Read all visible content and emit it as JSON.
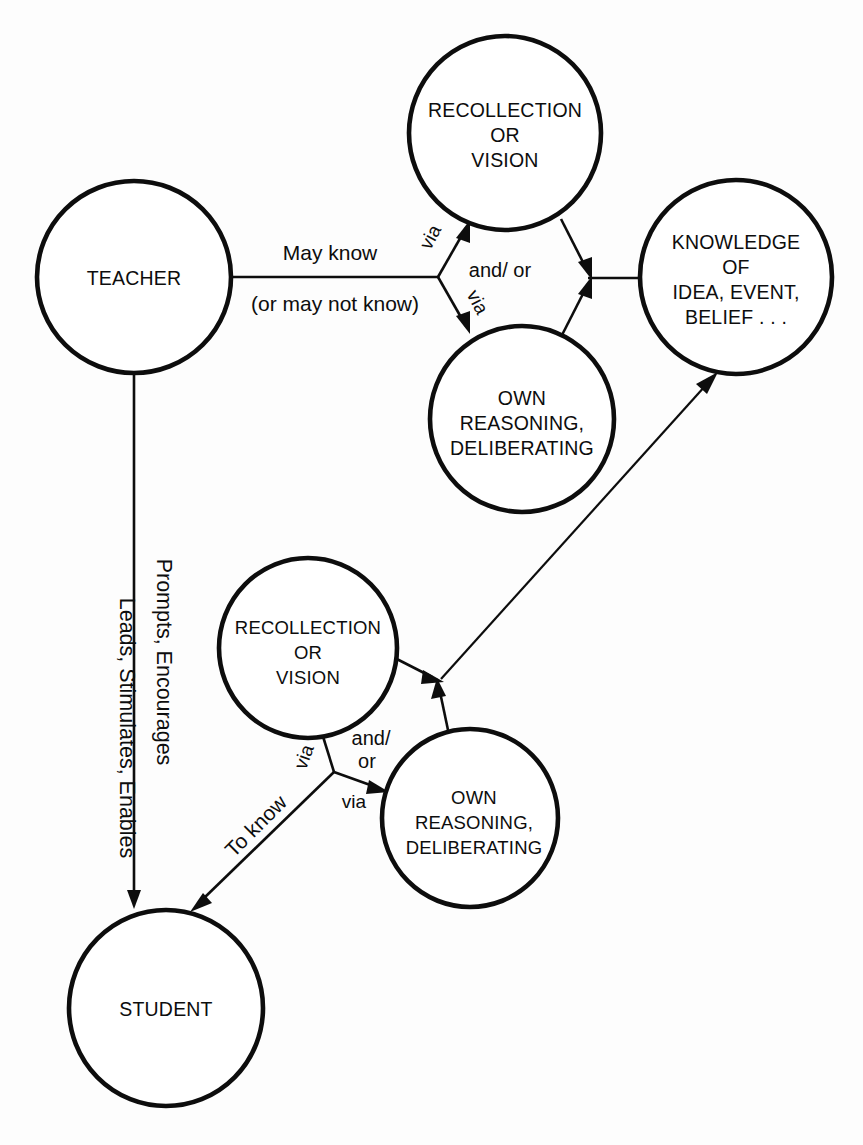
{
  "diagram": {
    "background_color": "#fdfdfd",
    "ink_color": "#0d0d0d",
    "nodes": {
      "teacher": {
        "lines": [
          "TEACHER"
        ]
      },
      "recollection_top": {
        "lines": [
          "RECOLLECTION",
          "OR",
          "VISION"
        ]
      },
      "own_reasoning_top": {
        "lines": [
          "OWN",
          "REASONING,",
          "DELIBERATING"
        ]
      },
      "knowledge": {
        "lines": [
          "KNOWLEDGE",
          "OF",
          "IDEA, EVENT,",
          "BELIEF . . ."
        ]
      },
      "recollection_bottom": {
        "lines": [
          "RECOLLECTION",
          "OR",
          "VISION"
        ]
      },
      "own_reasoning_bottom": {
        "lines": [
          "OWN",
          "REASONING,",
          "DELIBERATING"
        ]
      },
      "student": {
        "lines": [
          "STUDENT"
        ]
      }
    },
    "edge_labels": {
      "may_know": "May know",
      "may_not_know": "(or may not know)",
      "via_top_upper": "via",
      "via_top_lower": "via",
      "and_or_top": "and/ or",
      "leads_stimulates_enables": "Leads, Stimulates, Enables",
      "prompts_encourages": "Prompts, Encourages",
      "to_know": "To know",
      "via_bottom_upper": "via",
      "via_bottom_lower": "via",
      "and_or_bottom_line1": "and/",
      "and_or_bottom_line2": "or"
    }
  }
}
